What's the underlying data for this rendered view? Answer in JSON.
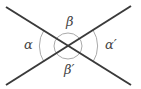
{
  "diagram": {
    "colors": {
      "line": "#3a3a3a",
      "arc": "#aaaaaa",
      "label": "#444444"
    },
    "lines": [
      {
        "name": "line-1",
        "x1": 6,
        "y1": 7,
        "x2": 131,
        "y2": 85
      },
      {
        "name": "line-2",
        "x1": 6,
        "y1": 85,
        "x2": 131,
        "y2": 6
      }
    ],
    "intersection": {
      "x": 68,
      "y": 46
    },
    "labels": {
      "alpha": "α",
      "beta": "β",
      "alpha_prime": "α′",
      "beta_prime": "β′"
    }
  }
}
